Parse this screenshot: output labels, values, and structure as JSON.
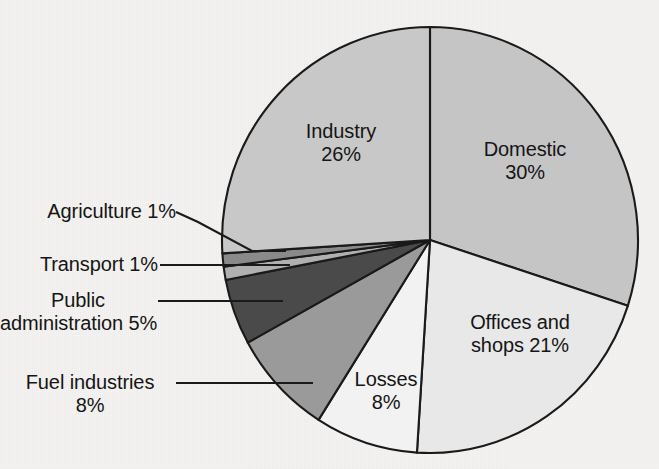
{
  "chart_data": {
    "type": "pie",
    "title": "",
    "subtitle": "",
    "xlabel": "",
    "ylabel": "",
    "legend_position": "none",
    "grid": false,
    "units": "percent",
    "total": 100,
    "start_angle_deg": 0,
    "direction": "clockwise",
    "categories": [
      "Domestic",
      "Offices and shops",
      "Losses",
      "Fuel industries",
      "Public administration",
      "Transport",
      "Agriculture",
      "Industry"
    ],
    "values": [
      30,
      21,
      8,
      8,
      5,
      1,
      1,
      26
    ],
    "slices": [
      {
        "name": "Domestic",
        "label_line1": "Domestic",
        "label_line2": "30%",
        "value": 30,
        "value_text": "30%",
        "color": "#c5c5c5",
        "label_placement": "inside"
      },
      {
        "name": "Offices and shops",
        "label_line1": "Offices and",
        "label_line2": "shops 21%",
        "value": 21,
        "value_text": "21%",
        "color": "#e8e8e8",
        "label_placement": "inside"
      },
      {
        "name": "Losses",
        "label_line1": "Losses",
        "label_line2": "8%",
        "value": 8,
        "value_text": "8%",
        "color": "#f2f2f2",
        "label_placement": "inside"
      },
      {
        "name": "Fuel industries",
        "label_line1": "Fuel industries",
        "label_line2": "8%",
        "value": 8,
        "value_text": "8%",
        "color": "#9a9a9a",
        "label_placement": "outside-left"
      },
      {
        "name": "Public administration",
        "label_line1": "Public",
        "label_line2": "administration 5%",
        "value": 5,
        "value_text": "5%",
        "color": "#4a4a4a",
        "label_placement": "outside-left"
      },
      {
        "name": "Transport",
        "label_line1": "Transport 1%",
        "label_line2": "",
        "value": 1,
        "value_text": "1%",
        "color": "#b0b0b0",
        "label_placement": "outside-left"
      },
      {
        "name": "Agriculture",
        "label_line1": "Agriculture 1%",
        "label_line2": "",
        "value": 1,
        "value_text": "1%",
        "color": "#8a8a8a",
        "label_placement": "outside-left"
      },
      {
        "name": "Industry",
        "label_line1": "Industry",
        "label_line2": "26%",
        "value": 26,
        "value_text": "26%",
        "color": "#c8c8c8",
        "label_placement": "inside"
      }
    ],
    "background_color": "#f4f3f1",
    "outline_color": "#1a1a1a"
  }
}
